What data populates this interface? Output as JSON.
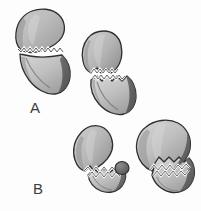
{
  "figure": {
    "background_color": "#fdfdfd",
    "panels": [
      {
        "id": "A",
        "label": "A",
        "label_color": "#3c3c3c",
        "description": "Transverse fracture with serrated fracture line across the bone neck; two specimen views, the left one intact-aligned and the right one displaced.",
        "specimens": [
          {
            "name": "specimen-a-left",
            "fracture_line": "transverse-serrated"
          },
          {
            "name": "specimen-a-right",
            "fracture_line": "transverse-serrated-displaced"
          }
        ]
      },
      {
        "id": "B",
        "label": "B",
        "label_color": "#3c3c3c",
        "description": "Oblique comminuted fracture with serrated fracture line; two specimen views showing separated and impacted fragments.",
        "specimens": [
          {
            "name": "specimen-b-left",
            "fracture_line": "oblique-serrated-separated"
          },
          {
            "name": "specimen-b-right",
            "fracture_line": "oblique-serrated-impacted"
          }
        ]
      }
    ],
    "colors": {
      "outline": "#2e2e2e",
      "bone_light": "#d2d2d2",
      "bone_mid": "#b2b2b2",
      "bone_dark": "#8e8e8e",
      "shadow": "#5a5a5a",
      "fracture_highlight": "#fbfbfb",
      "nodule": "#6d6d6d"
    }
  }
}
